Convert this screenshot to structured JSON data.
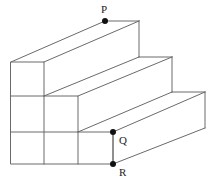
{
  "figure": {
    "type": "geometric-line-drawing",
    "background_color": "#ffffff",
    "line_color": "#6a6a6a",
    "line_width": 1,
    "marker_color": "#111111",
    "marker_radius": 3,
    "label_color": "#1c1c1c",
    "label_font_size": 11,
    "canvas": {
      "width": 221,
      "height": 185
    },
    "projection": {
      "description": "oblique projection, depth axis drawn back-to-the-right",
      "depth_dx": 94,
      "depth_dy": -41
    },
    "grid": {
      "front_face_x": [
        11,
        44,
        78,
        113
      ],
      "front_face_y": [
        62,
        96,
        132,
        164
      ],
      "cell_width": 33,
      "cell_height": 34,
      "steps": 3
    },
    "points": [
      {
        "name": "P",
        "label": "P",
        "x": 105,
        "y": 21,
        "label_x": 101,
        "label_y": 13,
        "marker": true
      },
      {
        "name": "Q",
        "label": "Q",
        "x": 113,
        "y": 132,
        "label_x": 119,
        "label_y": 144,
        "marker": true
      },
      {
        "name": "R",
        "label": "R",
        "x": 113,
        "y": 164,
        "label_x": 119,
        "label_y": 176,
        "marker": true
      }
    ],
    "front_outline": "M 11 62 L 44 62 L 44 96 L 78 96 L 78 132 L 113 132 L 113 164 L 11 164 Z",
    "front_grid_lines": [
      "M 44 96 L 44 164",
      "M 78 132 L 78 164",
      "M 11 96 L 44 96",
      "M 11 132 L 78 132"
    ],
    "top_and_side_edges": [
      "M 11 62 L 105 21",
      "M 105 21 L 139 21",
      "M 139 21 L 139 57",
      "M 44 62 L 139 21",
      "M 44 96 L 139 57",
      "M 139 57 L 172 57",
      "M 172 57 L 172 92",
      "M 78 96 L 172 57",
      "M 78 132 L 172 92",
      "M 172 92 L 205 92",
      "M 205 92 L 205 128",
      "M 113 132 L 205 92",
      "M 113 164 L 205 128"
    ],
    "segment_QR": "M 113 132 L 113 164"
  }
}
